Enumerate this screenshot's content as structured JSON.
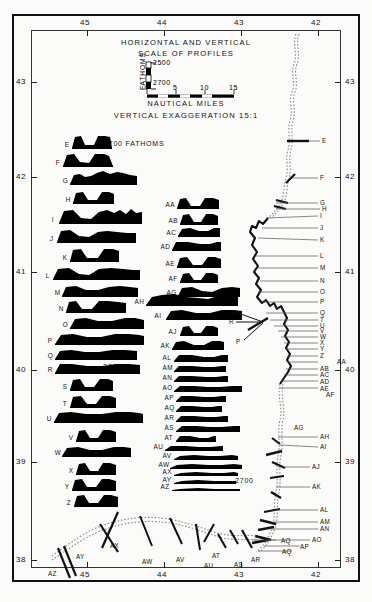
{
  "figure": {
    "title_line1": "HORIZONTAL AND VERTICAL",
    "title_line2": "SCALE OF PROFILES",
    "exaggeration": "VERTICAL EXAGGERATION 15:1",
    "nautical_label": "NAUTICAL MILES",
    "fathoms_label": "FATHOMS",
    "depth_top": "2500",
    "depth_bottom": "2700",
    "annotation_2700_fathoms": "2700 FATHOMS",
    "annotation_2700_col1": "2700",
    "annotation_2700_col2": "2700",
    "ink": "#000000",
    "paper": "#fbfbf9"
  },
  "scale_bar": {
    "ticks": [
      "0",
      "5",
      "10",
      "15"
    ]
  },
  "axes": {
    "top_labels": [
      "45",
      "44",
      "43",
      "42"
    ],
    "bottom_labels": [
      "45",
      "44",
      "43",
      "42"
    ],
    "left_labels": [
      "43",
      "42",
      "41",
      "40",
      "39",
      "38"
    ],
    "right_labels": [
      "43",
      "42",
      "41",
      "40",
      "39",
      "38"
    ],
    "xlabel": "",
    "ylabel": ""
  },
  "chart_data": {
    "type": "line",
    "subtitle": "VERTICAL EXAGGERATION 15:1",
    "xlabel": "West Longitude (degrees)",
    "ylabel": "North Latitude (degrees)",
    "xlim": [
      45.6,
      41.6
    ],
    "ylim": [
      37.9,
      43.4
    ],
    "grid": false,
    "legend": null,
    "scale_bar_nautical_miles": [
      0,
      5,
      10,
      15
    ],
    "depth_scale_fathoms": [
      2500,
      2700
    ],
    "vertical_exaggeration": "15:1",
    "column1": {
      "note": "Left stack of filled bathymetric profiles, 2700 fathom datum",
      "profiles": [
        {
          "label": "E",
          "y": 134,
          "left": 72,
          "w": 40,
          "pts": "0,14 3,3 9,2 13,11 22,11 26,2 33,2 38,3 40,14"
        },
        {
          "label": "F",
          "y": 152,
          "left": 63,
          "w": 50,
          "pts": "0,14 4,3 11,2 17,10 26,11 32,2 41,2 46,4 50,14"
        },
        {
          "label": "G",
          "y": 170,
          "left": 70,
          "w": 67,
          "pts": "0,14 4,5 10,4 15,7 21,6 27,3 33,1 40,4 47,2 53,3 60,5 67,6 67,14"
        },
        {
          "label": "H",
          "y": 190,
          "left": 73,
          "w": 41,
          "pts": "0,13 3,3 10,2 15,10 24,10 29,2 36,2 41,4 41,13"
        },
        {
          "label": "I",
          "y": 207,
          "left": 59,
          "w": 83,
          "pts": "0,16 5,4 14,3 22,11 32,12 40,5 48,3 55,6 61,3 67,7 72,2 77,6 83,5 83,16"
        },
        {
          "label": "J",
          "y": 227,
          "left": 57,
          "w": 79,
          "pts": "0,15 4,4 13,3 22,9 32,10 41,5 50,4 60,5 70,6 79,6 79,15"
        },
        {
          "label": "K",
          "y": 247,
          "left": 70,
          "w": 49,
          "pts": "0,14 3,3 11,2 17,11 28,11 34,2 43,2 49,4 49,14"
        },
        {
          "label": "L",
          "y": 265,
          "left": 53,
          "w": 87,
          "pts": "0,14 5,4 16,3 26,9 36,10 46,4 58,3 70,4 80,5 87,5 87,14"
        },
        {
          "label": "M",
          "y": 284,
          "left": 62,
          "w": 76,
          "pts": "0,12 4,3 14,2 24,6 36,6 47,3 58,2 68,3 76,4 76,12"
        },
        {
          "label": "N",
          "y": 299,
          "left": 66,
          "w": 60,
          "pts": "0,13 3,3 10,2 16,10 26,10 33,2 42,2 52,3 60,4 60,13"
        },
        {
          "label": "O",
          "y": 316,
          "left": 70,
          "w": 74,
          "pts": "0,12 5,3 16,2 28,5 42,5 55,2 65,2 74,4 74,12"
        },
        {
          "label": "P",
          "y": 332,
          "left": 55,
          "w": 89,
          "pts": "0,12 6,3 18,2 32,5 46,5 60,2 74,2 84,3 89,4 89,12"
        },
        {
          "label": "Q",
          "y": 348,
          "left": 55,
          "w": 82,
          "pts": "0,11 5,3 16,2 30,4 44,4 58,2 70,2 82,3 82,11"
        },
        {
          "label": "R",
          "y": 362,
          "left": 55,
          "w": 85,
          "pts": "0,11 5,2 17,2 32,4 48,4 62,2 74,2 85,3 85,11"
        },
        {
          "label": "S",
          "y": 377,
          "left": 70,
          "w": 43,
          "pts": "0,13 3,3 10,2 15,10 24,10 30,2 38,2 43,4 43,13"
        },
        {
          "label": "T",
          "y": 394,
          "left": 70,
          "w": 46,
          "pts": "0,13 3,3 11,2 17,10 26,10 32,2 40,2 46,4 46,13"
        },
        {
          "label": "U",
          "y": 410,
          "left": 54,
          "w": 89,
          "pts": "0,12 5,3 17,2 32,4 48,4 62,2 76,2 85,3 89,4 89,12"
        },
        {
          "label": "V",
          "y": 428,
          "left": 76,
          "w": 40,
          "pts": "0,13 3,3 9,2 14,10 22,10 27,2 34,2 40,4 40,13"
        },
        {
          "label": "W",
          "y": 445,
          "left": 62,
          "w": 69,
          "pts": "0,11 5,3 16,2 28,5 40,5 52,2 62,2 69,3 69,11"
        },
        {
          "label": "X",
          "y": 461,
          "left": 76,
          "w": 40,
          "pts": "0,13 3,3 9,2 14,10 22,10 27,2 34,2 40,4 40,13"
        },
        {
          "label": "Y",
          "y": 477,
          "left": 72,
          "w": 44,
          "pts": "0,13 3,3 10,2 15,10 24,10 30,2 37,2 44,4 44,13"
        },
        {
          "label": "Z",
          "y": 493,
          "left": 74,
          "w": 44,
          "pts": "0,13 3,3 10,2 15,10 24,10 30,2 37,2 44,4 44,13"
        }
      ]
    },
    "column2": {
      "note": "Middle stack of filled bathymetric profiles",
      "profiles": [
        {
          "label": "AA",
          "y": 196,
          "left": 177,
          "w": 42,
          "pts": "0,12 3,3 9,2 14,10 23,10 28,2 36,2 42,4 42,12"
        },
        {
          "label": "AB",
          "y": 212,
          "left": 180,
          "w": 38,
          "pts": "0,12 3,3 9,2 14,10 21,10 26,2 33,2 38,4 38,12"
        },
        {
          "label": "AC",
          "y": 226,
          "left": 178,
          "w": 42,
          "pts": "0,10 4,3 12,2 21,5 30,5 36,2 42,2 42,10"
        },
        {
          "label": "AD",
          "y": 240,
          "left": 172,
          "w": 49,
          "pts": "0,10 4,2 16,2 28,4 38,4 45,2 49,2 49,10"
        },
        {
          "label": "AE",
          "y": 255,
          "left": 177,
          "w": 44,
          "pts": "0,12 3,3 10,2 16,10 25,10 31,2 38,2 44,4 44,12"
        },
        {
          "label": "AF",
          "y": 271,
          "left": 180,
          "w": 38,
          "pts": "0,11 3,3 9,2 14,9 21,9 26,2 33,2 38,4 38,11"
        },
        {
          "label": "AG",
          "y": 285,
          "left": 178,
          "w": 62,
          "pts": "0,11 4,3 14,2 24,6 34,7 44,3 54,2 62,3 62,11"
        },
        {
          "label": "AH",
          "y": 292,
          "left": 146,
          "w": 92,
          "pts": "0,13 6,5 16,3 28,2 40,5 52,6 62,7 72,4 82,3 92,4 92,13"
        },
        {
          "label": "AI",
          "y": 308,
          "left": 166,
          "w": 76,
          "pts": "0,11 5,3 16,2 30,5 44,5 56,2 68,2 76,3 76,11"
        },
        {
          "label": "AJ",
          "y": 324,
          "left": 180,
          "w": 38,
          "pts": "0,11 3,3 9,2 14,9 21,9 26,2 33,2 38,4 38,11"
        },
        {
          "label": "AK",
          "y": 339,
          "left": 172,
          "w": 52,
          "pts": "0,10 4,3 12,2 22,6 32,6 40,2 48,2 52,3 52,10"
        },
        {
          "label": "AL",
          "y": 353,
          "left": 174,
          "w": 54,
          "pts": "0,8 5,2 18,2 30,4 40,4 48,2 54,2 54,8"
        },
        {
          "label": "AM",
          "y": 364,
          "left": 174,
          "w": 52,
          "pts": "0,7 5,2 18,2 30,3 40,3 48,2 52,2 52,7"
        },
        {
          "label": "AN",
          "y": 374,
          "left": 174,
          "w": 54,
          "pts": "0,7 5,2 18,2 32,3 42,3 50,2 54,2 54,7"
        },
        {
          "label": "AO",
          "y": 384,
          "left": 174,
          "w": 68,
          "pts": "0,7 6,2 20,2 34,3 46,3 58,2 68,2 68,7"
        },
        {
          "label": "AP",
          "y": 394,
          "left": 176,
          "w": 50,
          "pts": "0,7 5,2 16,2 28,3 38,3 46,2 50,2 50,7"
        },
        {
          "label": "AQ",
          "y": 404,
          "left": 176,
          "w": 46,
          "pts": "0,7 5,2 16,2 28,3 36,3 42,2 46,2 46,7"
        },
        {
          "label": "AR",
          "y": 414,
          "left": 176,
          "w": 52,
          "pts": "0,7 5,2 18,2 30,3 40,3 48,2 52,2 52,7"
        },
        {
          "label": "AS",
          "y": 424,
          "left": 176,
          "w": 64,
          "pts": "0,7 6,2 20,2 34,3 46,3 58,2 64,2 64,7"
        },
        {
          "label": "AT",
          "y": 434,
          "left": 176,
          "w": 40,
          "pts": "0,7 4,2 14,2 24,4 32,4 38,2 40,2 40,7"
        },
        {
          "label": "AU",
          "y": 444,
          "left": 165,
          "w": 58,
          "pts": "0,6 6,2 20,2 34,3 46,3 56,2 58,2 58,6"
        },
        {
          "label": "AV",
          "y": 454,
          "left": 174,
          "w": 64,
          "pts": "0,5 6,2 20,1 34,2 46,2 58,1 64,2 64,5"
        },
        {
          "label": "AW",
          "y": 463,
          "left": 170,
          "w": 72,
          "pts": "0,5 7,2 22,1 38,2 52,2 64,1 72,2 72,5"
        },
        {
          "label": "AX",
          "y": 471,
          "left": 174,
          "w": 64,
          "pts": "0,4 7,2 22,1 38,2 50,2 60,1 64,2 64,4"
        },
        {
          "label": "AY",
          "y": 479,
          "left": 174,
          "w": 62,
          "pts": "0,4 8,2 24,1 40,2 52,2 62,2 62,4"
        },
        {
          "label": "AZ",
          "y": 487,
          "left": 172,
          "w": 68,
          "pts": "0,3 8,2 26,1 42,2 56,2 68,2 68,3"
        }
      ]
    },
    "track": {
      "note": "Ship track (dotted survey line with bold crossing marks) and leader-line labels",
      "right_labels": [
        "E",
        "F",
        "G",
        "H",
        "I",
        "J",
        "K",
        "L",
        "M",
        "N",
        "O",
        "P",
        "Q",
        "R",
        "S",
        "T",
        "U",
        "V",
        "W",
        "X",
        "Y",
        "Z",
        "AA",
        "AB",
        "AC",
        "AD",
        "AE",
        "AF",
        "AG",
        "AH",
        "AI",
        "AJ",
        "AK",
        "AL",
        "AM",
        "AN",
        "AO",
        "AP",
        "AQ"
      ],
      "bottom_labels": [
        "AZ",
        "AY",
        "AX",
        "AW",
        "AV",
        "AU",
        "AT",
        "AS",
        "AR",
        "AQ"
      ]
    }
  }
}
